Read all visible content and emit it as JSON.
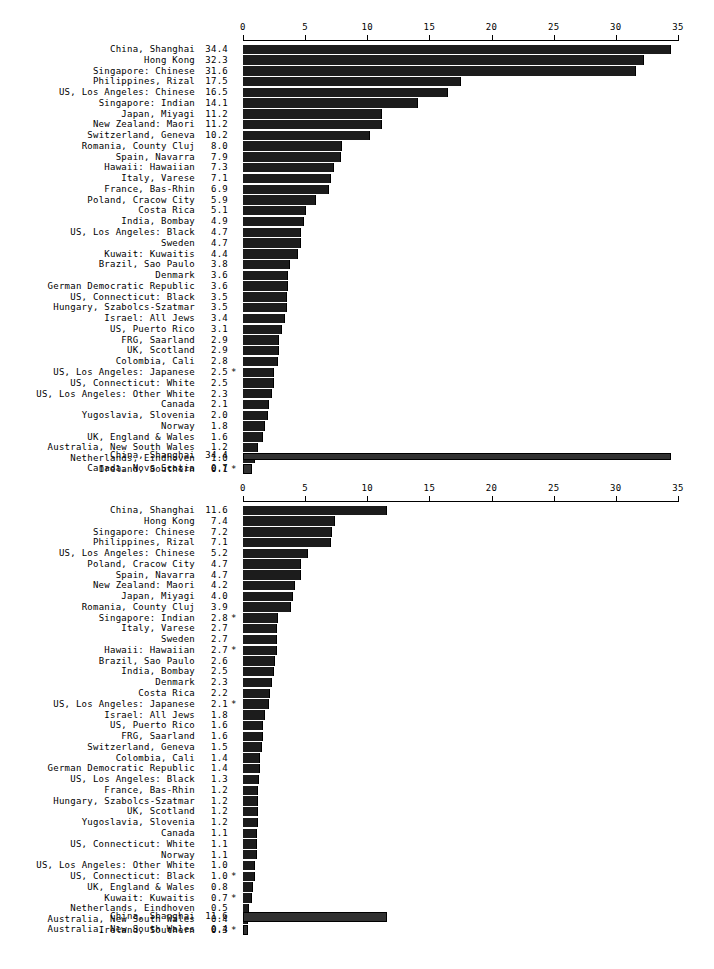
{
  "figure": {
    "background_color": "#ffffff",
    "bar_color": "#1c1c1c",
    "summary_bar_color": "#313131",
    "footnote_marker": "*"
  },
  "chart_data": [
    {
      "type": "bar",
      "orientation": "horizontal",
      "title": "",
      "xlabel": "",
      "ylabel": "",
      "xlim": [
        0,
        35
      ],
      "ticks": [
        0,
        5,
        10,
        15,
        20,
        25,
        30,
        35
      ],
      "tick_labels": [
        "0",
        "5",
        "10",
        "15",
        "20",
        "25",
        "30",
        "35"
      ],
      "grid": false,
      "legend": "none",
      "axis_position": "top",
      "categories": [
        "China, Shanghai",
        "Hong Kong",
        "Singapore: Chinese",
        "Philippines, Rizal",
        "US, Los Angeles: Chinese",
        "Singapore: Indian",
        "Japan, Miyagi",
        "New Zealand: Maori",
        "Switzerland, Geneva",
        "Romania, County Cluj",
        "Spain, Navarra",
        "Hawaii: Hawaiian",
        "Italy, Varese",
        "France, Bas-Rhin",
        "Poland, Cracow City",
        "Costa Rica",
        "India, Bombay",
        "US, Los Angeles: Black",
        "Sweden",
        "Kuwait: Kuwaitis",
        "Brazil, Sao Paulo",
        "Denmark",
        "German Democratic Republic",
        "US, Connecticut: Black",
        "Hungary, Szabolcs-Szatmar",
        "Israel: All Jews",
        "US, Puerto Rico",
        "FRG, Saarland",
        "UK, Scotland",
        "Colombia, Cali",
        "US, Los Angeles: Japanese",
        "US, Connecticut: White",
        "US, Los Angeles: Other White",
        "Canada",
        "Yugoslavia, Slovenia",
        "Norway",
        "UK, England & Wales",
        "Australia, New South Wales",
        "Netherlands, Eindhoven",
        "Ireland, Southern"
      ],
      "values": [
        34.4,
        32.3,
        31.6,
        17.5,
        16.5,
        14.1,
        11.2,
        11.2,
        10.2,
        8.0,
        7.9,
        7.3,
        7.1,
        6.9,
        5.9,
        5.1,
        4.9,
        4.7,
        4.7,
        4.4,
        3.8,
        3.6,
        3.6,
        3.5,
        3.5,
        3.4,
        3.1,
        2.9,
        2.9,
        2.8,
        2.5,
        2.5,
        2.3,
        2.1,
        2.0,
        1.8,
        1.6,
        1.2,
        1.0,
        0.1
      ],
      "value_labels": [
        "34.4",
        "32.3",
        "31.6",
        "17.5",
        "16.5",
        "14.1",
        "11.2",
        "11.2",
        "10.2",
        "8.0",
        "7.9",
        "7.3",
        "7.1",
        "6.9",
        "5.9",
        "5.1",
        "4.9",
        "4.7",
        "4.7",
        "4.4",
        "3.8",
        "3.6",
        "3.6",
        "3.5",
        "3.5",
        "3.4",
        "3.1",
        "2.9",
        "2.9",
        "2.8",
        "2.5",
        "2.5",
        "2.3",
        "2.1",
        "2.0",
        "1.8",
        "1.6",
        "1.2",
        "1.0",
        "0.1"
      ],
      "starred": [
        false,
        false,
        false,
        false,
        false,
        false,
        false,
        false,
        false,
        false,
        false,
        false,
        false,
        false,
        false,
        false,
        false,
        false,
        false,
        false,
        false,
        false,
        false,
        false,
        false,
        false,
        false,
        false,
        false,
        false,
        true,
        false,
        false,
        false,
        false,
        false,
        false,
        false,
        false,
        true
      ],
      "summary": {
        "categories": [
          "China, Shanghai",
          "Canada, Nova Scotia"
        ],
        "values": [
          34.4,
          0.7
        ],
        "value_labels": [
          "34.4",
          "0.7"
        ],
        "starred": [
          false,
          false
        ]
      }
    },
    {
      "type": "bar",
      "orientation": "horizontal",
      "title": "",
      "xlabel": "",
      "ylabel": "",
      "xlim": [
        0,
        35
      ],
      "ticks": [
        0,
        5,
        10,
        15,
        20,
        25,
        30,
        35
      ],
      "tick_labels": [
        "0",
        "5",
        "10",
        "15",
        "20",
        "25",
        "30",
        "35"
      ],
      "grid": false,
      "legend": "none",
      "axis_position": "top",
      "categories": [
        "China, Shanghai",
        "Hong Kong",
        "Singapore: Chinese",
        "Philippines, Rizal",
        "US, Los Angeles: Chinese",
        "Poland, Cracow City",
        "Spain, Navarra",
        "New Zealand: Maori",
        "Japan, Miyagi",
        "Romania, County Cluj",
        "Singapore: Indian",
        "Italy, Varese",
        "Sweden",
        "Hawaii: Hawaiian",
        "Brazil, Sao Paulo",
        "India, Bombay",
        "Denmark",
        "Costa Rica",
        "US, Los Angeles: Japanese",
        "Israel: All Jews",
        "US, Puerto Rico",
        "FRG, Saarland",
        "Switzerland, Geneva",
        "Colombia, Cali",
        "German Democratic Republic",
        "US, Los Angeles: Black",
        "France, Bas-Rhin",
        "Hungary, Szabolcs-Szatmar",
        "UK, Scotland",
        "Yugoslavia, Slovenia",
        "Canada",
        "US, Connecticut: White",
        "Norway",
        "US, Los Angeles: Other White",
        "US, Connecticut: Black",
        "UK, England & Wales",
        "Kuwait: Kuwaitis",
        "Netherlands, Eindhoven",
        "Australia, New South Wales",
        "Ireland, Southern"
      ],
      "values": [
        11.6,
        7.4,
        7.2,
        7.1,
        5.2,
        4.7,
        4.7,
        4.2,
        4.0,
        3.9,
        2.8,
        2.7,
        2.7,
        2.7,
        2.6,
        2.5,
        2.3,
        2.2,
        2.1,
        1.8,
        1.6,
        1.6,
        1.5,
        1.4,
        1.4,
        1.3,
        1.2,
        1.2,
        1.2,
        1.2,
        1.1,
        1.1,
        1.1,
        1.0,
        1.0,
        0.8,
        0.7,
        0.5,
        0.4,
        0.3
      ],
      "value_labels": [
        "11.6",
        "7.4",
        "7.2",
        "7.1",
        "5.2",
        "4.7",
        "4.7",
        "4.2",
        "4.0",
        "3.9",
        "2.8",
        "2.7",
        "2.7",
        "2.7",
        "2.6",
        "2.5",
        "2.3",
        "2.2",
        "2.1",
        "1.8",
        "1.6",
        "1.6",
        "1.5",
        "1.4",
        "1.4",
        "1.3",
        "1.2",
        "1.2",
        "1.2",
        "1.2",
        "1.1",
        "1.1",
        "1.1",
        "1.0",
        "1.0",
        "0.8",
        "0.7",
        "0.5",
        "0.4",
        "0.3"
      ],
      "starred": [
        false,
        false,
        false,
        false,
        false,
        false,
        false,
        false,
        false,
        false,
        true,
        false,
        false,
        true,
        false,
        false,
        false,
        false,
        true,
        false,
        false,
        false,
        false,
        false,
        false,
        false,
        false,
        false,
        false,
        false,
        false,
        false,
        false,
        false,
        true,
        false,
        true,
        false,
        false,
        true
      ],
      "summary": {
        "categories": [
          "China, Shanghai",
          "Australia, New South Wales"
        ],
        "values": [
          11.6,
          0.4
        ],
        "value_labels": [
          "11.6",
          "0.4"
        ],
        "starred": [
          false,
          false
        ]
      }
    }
  ]
}
